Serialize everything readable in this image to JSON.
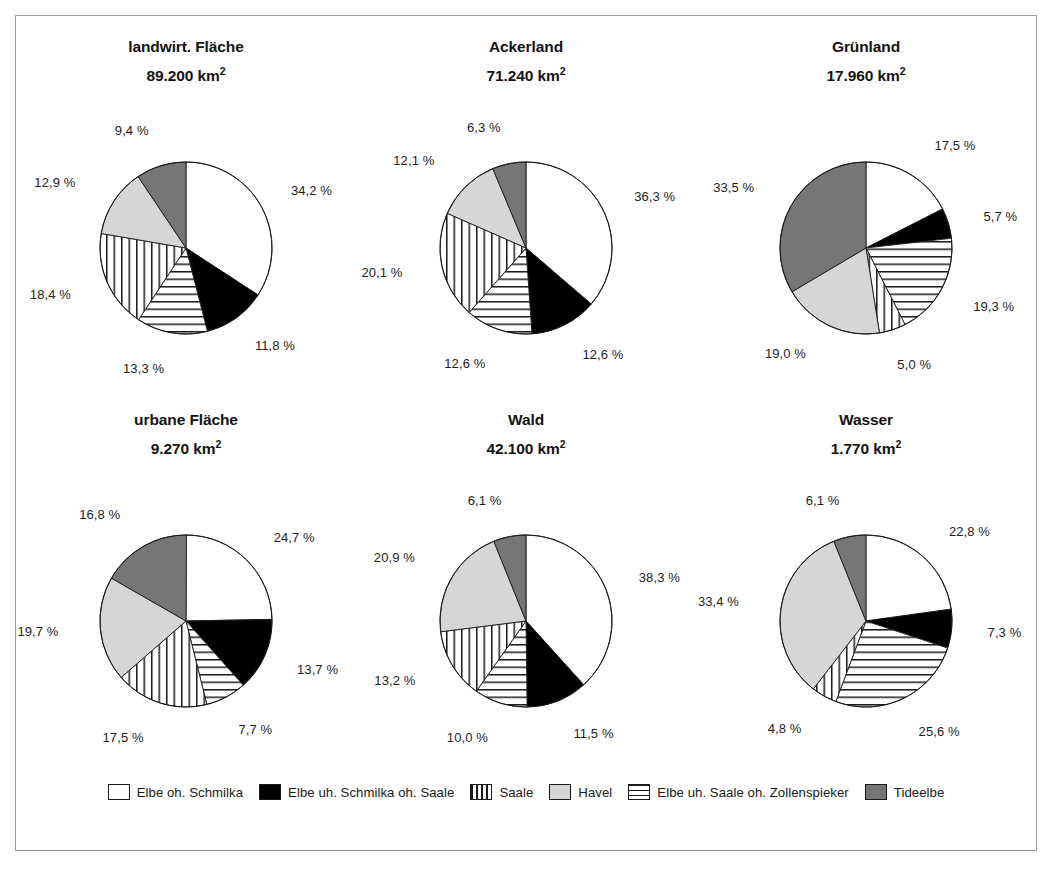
{
  "figure": {
    "title": "",
    "border_color": "#9b9b9b",
    "background": "#ffffff"
  },
  "legend": {
    "position": "bottom",
    "items": [
      {
        "label": "Elbe oh. Schmilka",
        "key": "elbe_oh_schmilka",
        "fill": "#ffffff",
        "pattern": "solid"
      },
      {
        "label": "Elbe uh. Schmilka oh. Saale",
        "key": "elbe_uh_schmilka_oh_saale",
        "fill": "#000000",
        "pattern": "solid"
      },
      {
        "label": "Saale",
        "key": "saale",
        "fill": "#ffffff",
        "pattern": "vertical"
      },
      {
        "label": "Havel",
        "key": "havel",
        "fill": "#d6d6d6",
        "pattern": "solid"
      },
      {
        "label": "Elbe uh. Saale oh. Zollenspieker",
        "key": "elbe_uh_saale_oh_zoll",
        "fill": "#ffffff",
        "pattern": "horizontal"
      },
      {
        "label": "Tideelbe",
        "key": "tideelbe",
        "fill": "#767676",
        "pattern": "solid"
      }
    ]
  },
  "chart_data": {
    "type": "pie",
    "title": "",
    "xlabel": "",
    "ylabel": "",
    "grid": false,
    "legend_position": "bottom",
    "units": "km²",
    "value_format": "German decimal comma, percent with thin space",
    "categories": [
      "Elbe oh. Schmilka",
      "Elbe uh. Schmilka oh. Saale",
      "Elbe uh. Saale oh. Zollenspieker",
      "Saale",
      "Havel",
      "Tideelbe"
    ],
    "charts": [
      {
        "id": "landwirt-flaeche",
        "title": "landwirt. Fläche",
        "subtitle": "89.200 km²",
        "total_value": 89200,
        "values": [
          34.2,
          11.8,
          13.3,
          18.4,
          12.9,
          9.4
        ],
        "labels": [
          "34,2 %",
          "11,8 %",
          "13,3 %",
          "18,4 %",
          "12,9 %",
          "9,4 %"
        ]
      },
      {
        "id": "ackerland",
        "title": "Ackerland",
        "subtitle": "71.240 km²",
        "total_value": 71240,
        "values": [
          36.3,
          12.6,
          12.6,
          20.1,
          12.1,
          6.3
        ],
        "labels": [
          "36,3 %",
          "12,6 %",
          "12,6 %",
          "20,1 %",
          "12,1 %",
          "6,3 %"
        ]
      },
      {
        "id": "gruenland",
        "title": "Grünland",
        "subtitle": "17.960 km²",
        "total_value": 17960,
        "values": [
          17.5,
          5.7,
          19.3,
          5.0,
          19.0,
          33.5
        ],
        "labels": [
          "17,5 %",
          "5,7 %",
          "19,3 %",
          "5,0 %",
          "19,0 %",
          "33,5 %"
        ]
      },
      {
        "id": "urbane-flaeche",
        "title": "urbane Fläche",
        "subtitle": "9.270 km²",
        "total_value": 9270,
        "values": [
          24.7,
          13.7,
          7.7,
          17.5,
          19.7,
          16.8
        ],
        "labels": [
          "24,7 %",
          "13,7 %",
          "7,7 %",
          "17,5 %",
          "19,7 %",
          "16,8 %"
        ]
      },
      {
        "id": "wald",
        "title": "Wald",
        "subtitle": "42.100 km²",
        "total_value": 42100,
        "values": [
          38.3,
          11.5,
          10.0,
          13.2,
          20.9,
          6.1
        ],
        "labels": [
          "38,3 %",
          "11,5 %",
          "10,0 %",
          "13,2 %",
          "20,9 %",
          "6,1 %"
        ]
      },
      {
        "id": "wasser",
        "title": "Wasser",
        "subtitle": "1.770 km²",
        "total_value": 1770,
        "values": [
          22.8,
          7.3,
          25.6,
          4.8,
          33.4,
          6.1
        ],
        "labels": [
          "22,8 %",
          "7,3 %",
          "25,6 %",
          "4,8 %",
          "33,4 %",
          "6,1 %"
        ]
      }
    ]
  }
}
